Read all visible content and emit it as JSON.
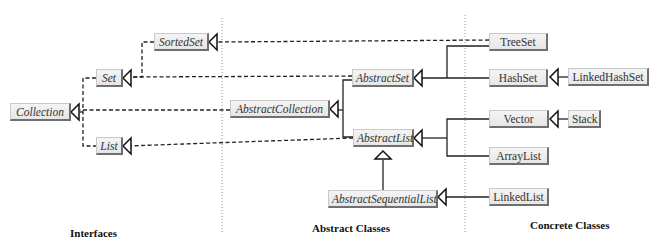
{
  "diagram": {
    "sections": [
      {
        "id": "interfaces",
        "label": "Interfaces"
      },
      {
        "id": "abstract",
        "label": "Abstract Classes"
      },
      {
        "id": "concrete",
        "label": "Concrete Classes"
      }
    ],
    "nodes": {
      "collection": {
        "label": "Collection",
        "kind": "interface"
      },
      "set": {
        "label": "Set",
        "kind": "interface"
      },
      "sortedset": {
        "label": "SortedSet",
        "kind": "interface"
      },
      "list": {
        "label": "List",
        "kind": "interface"
      },
      "abstractcollection": {
        "label": "AbstractCollection",
        "kind": "abstract"
      },
      "abstractset": {
        "label": "AbstractSet",
        "kind": "abstract"
      },
      "abstractlist": {
        "label": "AbstractList",
        "kind": "abstract"
      },
      "abstractsequentiallist": {
        "label": "AbstractSequentialList",
        "kind": "abstract"
      },
      "treeset": {
        "label": "TreeSet",
        "kind": "concrete"
      },
      "hashset": {
        "label": "HashSet",
        "kind": "concrete"
      },
      "linkedhashset": {
        "label": "LinkedHashSet",
        "kind": "concrete"
      },
      "vector": {
        "label": "Vector",
        "kind": "concrete"
      },
      "stack": {
        "label": "Stack",
        "kind": "concrete"
      },
      "arraylist": {
        "label": "ArrayList",
        "kind": "concrete"
      },
      "linkedlist": {
        "label": "LinkedList",
        "kind": "concrete"
      }
    },
    "edges": [
      {
        "from": "set",
        "to": "collection",
        "type": "implements"
      },
      {
        "from": "list",
        "to": "collection",
        "type": "implements"
      },
      {
        "from": "sortedset",
        "to": "set",
        "type": "implements"
      },
      {
        "from": "abstractcollection",
        "to": "collection",
        "type": "implements"
      },
      {
        "from": "abstractset",
        "to": "set",
        "type": "implements"
      },
      {
        "from": "abstractlist",
        "to": "list",
        "type": "implements"
      },
      {
        "from": "treeset",
        "to": "sortedset",
        "type": "implements"
      },
      {
        "from": "abstractset",
        "to": "abstractcollection",
        "type": "extends"
      },
      {
        "from": "abstractlist",
        "to": "abstractcollection",
        "type": "extends"
      },
      {
        "from": "abstractsequentiallist",
        "to": "abstractlist",
        "type": "extends"
      },
      {
        "from": "treeset",
        "to": "abstractset",
        "type": "extends"
      },
      {
        "from": "hashset",
        "to": "abstractset",
        "type": "extends"
      },
      {
        "from": "linkedhashset",
        "to": "hashset",
        "type": "extends"
      },
      {
        "from": "vector",
        "to": "abstractlist",
        "type": "extends"
      },
      {
        "from": "arraylist",
        "to": "abstractlist",
        "type": "extends"
      },
      {
        "from": "stack",
        "to": "vector",
        "type": "extends"
      },
      {
        "from": "linkedlist",
        "to": "abstractsequentiallist",
        "type": "extends"
      }
    ]
  }
}
